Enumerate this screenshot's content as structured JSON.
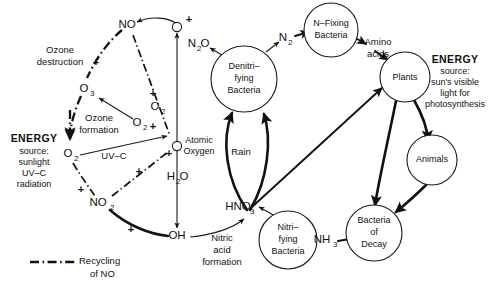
{
  "diagram": {
    "colors": {
      "ink": "#111111",
      "background": "#ffffff"
    },
    "nodes": {
      "atomic_oxygen": {
        "label_line1": "Atomic",
        "label_line2": "Oxygen"
      },
      "top_o": {
        "label": "O"
      },
      "no": {
        "label": "NO"
      },
      "o3": {
        "label": "O",
        "sub": "3"
      },
      "o2_left": {
        "label": "O",
        "sub": "2"
      },
      "o2_mid": {
        "label": "O",
        "sub": "2"
      },
      "o2_upper": {
        "label": "O",
        "sub": "2"
      },
      "no2": {
        "label": "NO",
        "sub": "2"
      },
      "oh": {
        "label": "OH"
      },
      "h2o": {
        "label": "H",
        "sub": "2",
        "label_tail": "O"
      },
      "hno3": {
        "label": "HNO",
        "sub": "3"
      },
      "n2o": {
        "label": "N",
        "sub": "2",
        "label_tail": "O"
      },
      "n2": {
        "label": "N",
        "sub": "2"
      },
      "nh3": {
        "label": "NH",
        "sub": "3"
      },
      "denitrifying_bacteria": {
        "line1": "Denitri–",
        "line2": "fying",
        "line3": "Bacteria"
      },
      "n_fixing_bacteria": {
        "line1": "N–Fixing",
        "line2": "Bacteria"
      },
      "plants": {
        "label": "Plants"
      },
      "animals": {
        "label": "Animals"
      },
      "bacteria_of_decay": {
        "line1": "Bacteria",
        "line2": "of",
        "line3": "Decay"
      },
      "nitrifying_bacteria": {
        "line1": "Nitri–",
        "line2": "fying",
        "line3": "Bacteria"
      }
    },
    "process_labels": {
      "ozone_destruction": {
        "line1": "Ozone",
        "line2": "destruction"
      },
      "ozone_formation": {
        "line1": "Ozone",
        "line2": "formation"
      },
      "uv_c": {
        "label": "UV–C"
      },
      "rain": {
        "label": "Rain"
      },
      "nitric_acid_formation": {
        "line1": "Nitric",
        "line2": "acid",
        "line3": "formation"
      },
      "amino_acids": {
        "line1": "Amino",
        "line2": "acids"
      }
    },
    "energy_left": {
      "heading": "ENERGY",
      "line1": "source:",
      "line2": "sunlight",
      "line3": "UV–C",
      "line4": "radiation"
    },
    "energy_right": {
      "heading": "ENERGY",
      "line1": "source:",
      "line2": "sun's visible",
      "line3": "light for",
      "line4": "photosynthesis"
    },
    "legend": {
      "line1": "Recycling",
      "line2": "of  NO",
      "style": "dash-dot"
    },
    "plus_signs": [
      {
        "name": "plus-top-o",
        "x": 189,
        "y": 20
      },
      {
        "name": "plus-ozone-destruction",
        "x": 96,
        "y": 63
      },
      {
        "name": "plus-o2-branch",
        "x": 153,
        "y": 94
      },
      {
        "name": "plus-atomic-left",
        "x": 153,
        "y": 127
      },
      {
        "name": "plus-atomic-below",
        "x": 169,
        "y": 154
      },
      {
        "name": "plus-no2-branch",
        "x": 139,
        "y": 172
      },
      {
        "name": "plus-no2-upper",
        "x": 81,
        "y": 190
      },
      {
        "name": "plus-oh-branch",
        "x": 131,
        "y": 230
      }
    ]
  }
}
